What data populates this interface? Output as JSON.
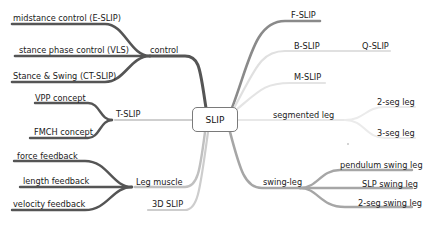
{
  "map": {
    "center": "SLIP",
    "colors": {
      "dark": "#555555",
      "mid": "#8a8a8a",
      "light": "#c8c8c8",
      "faint": "#e2e2e2"
    },
    "left": {
      "control": {
        "label": "control",
        "children": [
          "midstance control (E-SLIP)",
          "stance phase control (VLS)",
          "Stance & Swing (CT-SLIP)"
        ]
      },
      "tslip": {
        "label": "T-SLIP",
        "children": [
          "VPP concept",
          "FMCH concept"
        ]
      },
      "legmuscle": {
        "label": "Leg muscle",
        "children": [
          "force feedback",
          "length feedback",
          "velocity feedback"
        ]
      },
      "slip3d": {
        "label": "3D SLIP"
      }
    },
    "right": {
      "fslip": {
        "label": "F-SLIP"
      },
      "bslip": {
        "label": "B-SLIP",
        "children": [
          "Q-SLIP"
        ]
      },
      "mslip": {
        "label": "M-SLIP"
      },
      "segmented": {
        "label": "segmented leg",
        "children": [
          "2-seg leg",
          "3-seg leg"
        ]
      },
      "swing": {
        "label": "swing-leg",
        "children": [
          "pendulum swing leg",
          "SLP swing leg",
          "2-seg swing leg"
        ]
      }
    }
  }
}
